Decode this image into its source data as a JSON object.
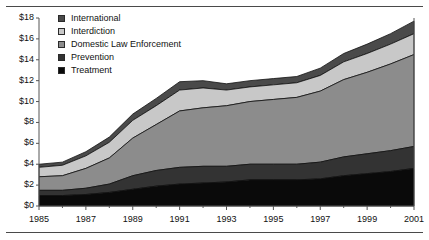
{
  "chart_data": {
    "type": "area",
    "stacked": true,
    "title": "",
    "xlabel": "",
    "ylabel": "",
    "ylim": [
      0,
      18
    ],
    "xlim": [
      1985,
      2001
    ],
    "grid": false,
    "legend_position": "top-left",
    "y_ticks": [
      "$0",
      "$2",
      "$4",
      "$6",
      "$8",
      "$10",
      "$12",
      "$14",
      "$16",
      "$18"
    ],
    "y_tick_values": [
      0,
      2,
      4,
      6,
      8,
      10,
      12,
      14,
      16,
      18
    ],
    "x": [
      1985,
      1986,
      1987,
      1988,
      1989,
      1990,
      1991,
      1992,
      1993,
      1994,
      1995,
      1996,
      1997,
      1998,
      1999,
      2000,
      2001
    ],
    "x_tick_labels": [
      "1985",
      "1987",
      "1989",
      "1991",
      "1993",
      "1995",
      "1997",
      "1999",
      "2001"
    ],
    "x_tick_values": [
      1985,
      1987,
      1989,
      1991,
      1993,
      1995,
      1997,
      1999,
      2001
    ],
    "series": [
      {
        "name": "Treatment",
        "color": "#0a0a0a",
        "values": [
          1.0,
          1.0,
          1.1,
          1.3,
          1.6,
          1.9,
          2.1,
          2.2,
          2.3,
          2.5,
          2.5,
          2.5,
          2.6,
          2.9,
          3.1,
          3.3,
          3.6
        ]
      },
      {
        "name": "Prevention",
        "color": "#333333",
        "values": [
          0.5,
          0.5,
          0.6,
          0.8,
          1.3,
          1.5,
          1.6,
          1.6,
          1.5,
          1.5,
          1.5,
          1.5,
          1.6,
          1.8,
          1.9,
          2.0,
          2.1
        ]
      },
      {
        "name": "Domestic Law Enforcement",
        "color": "#8c8c8c",
        "values": [
          1.3,
          1.4,
          1.9,
          2.5,
          3.6,
          4.4,
          5.4,
          5.6,
          5.8,
          6.0,
          6.2,
          6.4,
          6.8,
          7.4,
          7.8,
          8.3,
          8.8
        ]
      },
      {
        "name": "Interdiction",
        "color": "#c8c8c8",
        "values": [
          0.9,
          1.0,
          1.2,
          1.5,
          1.7,
          1.8,
          2.0,
          1.9,
          1.5,
          1.4,
          1.4,
          1.4,
          1.5,
          1.7,
          1.8,
          1.9,
          2.0
        ]
      },
      {
        "name": "International",
        "color": "#4a4a4a",
        "values": [
          0.3,
          0.3,
          0.4,
          0.5,
          0.6,
          0.7,
          0.8,
          0.7,
          0.6,
          0.6,
          0.6,
          0.6,
          0.7,
          0.8,
          0.9,
          1.0,
          1.2
        ]
      }
    ],
    "totals": [
      4.0,
      4.2,
      5.2,
      6.6,
      8.8,
      10.3,
      11.9,
      12.0,
      11.7,
      12.0,
      12.2,
      12.4,
      13.2,
      14.6,
      15.5,
      16.5,
      17.7
    ]
  },
  "legend": {
    "items": [
      {
        "label": "International",
        "color": "#4a4a4a"
      },
      {
        "label": "Interdiction",
        "color": "#c8c8c8"
      },
      {
        "label": "Domestic Law Enforcement",
        "color": "#8c8c8c"
      },
      {
        "label": "Prevention",
        "color": "#333333"
      },
      {
        "label": "Treatment",
        "color": "#0a0a0a"
      }
    ]
  },
  "axis": {
    "line_color": "#555555",
    "text_color": "#111111"
  }
}
